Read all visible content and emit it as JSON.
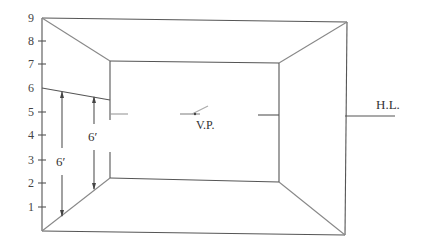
{
  "diagram": {
    "title": "",
    "scale": {
      "labels": [
        "9",
        "8",
        "7",
        "6",
        "5",
        "4",
        "3",
        "2",
        "1"
      ]
    },
    "labels": {
      "vanishing_point": "V.P.",
      "horizon_line": "H.L.",
      "height_left": "6′",
      "height_right": "6′"
    },
    "line_color": "#444444"
  }
}
